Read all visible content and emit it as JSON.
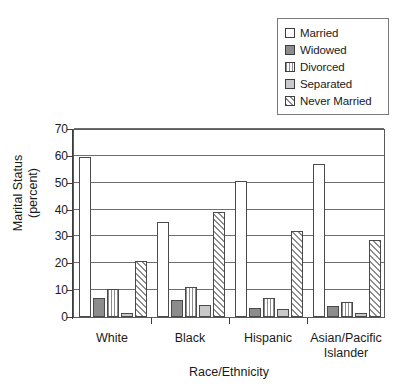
{
  "chart_data": {
    "type": "bar",
    "title": "",
    "xlabel": "Race/Ethnicity",
    "ylabel": "Marital Status\n(percent)",
    "ylabel_line1": "Marital Status",
    "ylabel_line2": "(percent)",
    "categories": [
      "White",
      "Black",
      "Hispanic",
      "Asian/Pacific Islander"
    ],
    "category_lines": [
      [
        "White"
      ],
      [
        "Black"
      ],
      [
        "Hispanic"
      ],
      [
        "Asian/Pacific",
        "Islander"
      ]
    ],
    "ylim": [
      0,
      70
    ],
    "ytick_labels": [
      "0",
      "10",
      "20",
      "30",
      "40",
      "50",
      "60",
      "70"
    ],
    "ytick_values": [
      0,
      10,
      20,
      30,
      40,
      50,
      60,
      70
    ],
    "grid": "horizontal",
    "legend_position": "top-right",
    "series": [
      {
        "name": "Married",
        "swatch": "white-square-icon",
        "color": "#ffffff",
        "pattern": "solid",
        "values": [
          59.5,
          35.5,
          50.5,
          57.0
        ]
      },
      {
        "name": "Widowed",
        "swatch": "dark-gray-square-icon",
        "color": "#8c8c8c",
        "pattern": "solid",
        "values": [
          7.0,
          6.5,
          3.5,
          4.0
        ]
      },
      {
        "name": "Divorced",
        "swatch": "vertical-stripe-square-icon",
        "color": "#8c8c8c",
        "pattern": "vertical-stripes",
        "values": [
          10.5,
          11.0,
          7.0,
          5.5
        ]
      },
      {
        "name": "Separated",
        "swatch": "light-gray-square-icon",
        "color": "#c9c9c9",
        "pattern": "solid",
        "values": [
          1.5,
          4.5,
          3.0,
          1.5
        ]
      },
      {
        "name": "Never Married",
        "swatch": "diagonal-hatch-square-icon",
        "color": "#8c8c8c",
        "pattern": "diagonal-hatch",
        "values": [
          21.0,
          39.0,
          32.0,
          28.5
        ]
      }
    ]
  },
  "legend": {
    "items": [
      {
        "label": "Married"
      },
      {
        "label": "Widowed"
      },
      {
        "label": "Divorced"
      },
      {
        "label": "Separated"
      },
      {
        "label": "Never Married"
      }
    ]
  }
}
